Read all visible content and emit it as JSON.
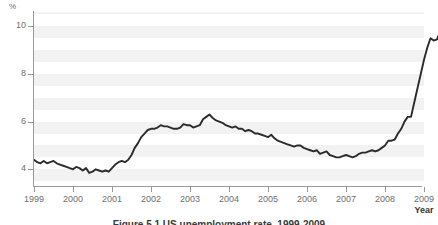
{
  "figure": {
    "caption": "Figure 5.1 US unemployment rate, 1999-2009",
    "unit_label": "%"
  },
  "chart_data": {
    "type": "line",
    "title": "US unemployment rate, 1999-2009",
    "xlabel": "Year",
    "ylabel": "%",
    "xlim": [
      1999,
      2009
    ],
    "ylim": [
      3.3,
      10.6
    ],
    "grid": false,
    "legend": "none",
    "banded_background": true,
    "x_tick_labels": [
      "1999",
      "2000",
      "2001",
      "2002",
      "2003",
      "2004",
      "2005",
      "2006",
      "2007",
      "2008",
      "2009"
    ],
    "x_ticks": [
      1999,
      2000,
      2001,
      2002,
      2003,
      2004,
      2005,
      2006,
      2007,
      2008,
      2009
    ],
    "y_tick_labels": [
      "4",
      "6",
      "8",
      "10"
    ],
    "y_ticks": [
      4,
      6,
      8,
      10
    ],
    "series": [
      {
        "name": "US unemployment rate",
        "color": "#2b2b2b",
        "x": [
          1999.0,
          1999.083,
          1999.167,
          1999.25,
          1999.333,
          1999.417,
          1999.5,
          1999.583,
          1999.667,
          1999.75,
          1999.833,
          1999.917,
          2000.0,
          2000.083,
          2000.167,
          2000.25,
          2000.333,
          2000.417,
          2000.5,
          2000.583,
          2000.667,
          2000.75,
          2000.833,
          2000.917,
          2001.0,
          2001.083,
          2001.167,
          2001.25,
          2001.333,
          2001.417,
          2001.5,
          2001.583,
          2001.667,
          2001.75,
          2001.833,
          2001.917,
          2002.0,
          2002.083,
          2002.167,
          2002.25,
          2002.333,
          2002.417,
          2002.5,
          2002.583,
          2002.667,
          2002.75,
          2002.833,
          2002.917,
          2003.0,
          2003.083,
          2003.167,
          2003.25,
          2003.333,
          2003.417,
          2003.5,
          2003.583,
          2003.667,
          2003.75,
          2003.833,
          2003.917,
          2004.0,
          2004.083,
          2004.167,
          2004.25,
          2004.333,
          2004.417,
          2004.5,
          2004.583,
          2004.667,
          2004.75,
          2004.833,
          2004.917,
          2005.0,
          2005.083,
          2005.167,
          2005.25,
          2005.333,
          2005.417,
          2005.5,
          2005.583,
          2005.667,
          2005.75,
          2005.833,
          2005.917,
          2006.0,
          2006.083,
          2006.167,
          2006.25,
          2006.333,
          2006.417,
          2006.5,
          2006.583,
          2006.667,
          2006.75,
          2006.833,
          2006.917,
          2007.0,
          2007.083,
          2007.167,
          2007.25,
          2007.333,
          2007.417,
          2007.5,
          2007.583,
          2007.667,
          2007.75,
          2007.833,
          2007.917,
          2008.0,
          2008.083,
          2008.167,
          2008.25,
          2008.333,
          2008.417,
          2008.5,
          2008.583,
          2008.667,
          2008.75,
          2008.833,
          2008.917,
          2009.0
        ],
        "values": [
          4.4,
          4.3,
          4.25,
          4.35,
          4.25,
          4.3,
          4.35,
          4.25,
          4.2,
          4.15,
          4.1,
          4.05,
          4.0,
          4.1,
          4.05,
          3.95,
          4.05,
          3.85,
          3.9,
          4.0,
          3.95,
          3.9,
          3.95,
          3.9,
          4.05,
          4.2,
          4.3,
          4.35,
          4.3,
          4.4,
          4.6,
          4.9,
          5.1,
          5.35,
          5.5,
          5.65,
          5.7,
          5.7,
          5.75,
          5.85,
          5.8,
          5.8,
          5.75,
          5.7,
          5.7,
          5.75,
          5.9,
          5.85,
          5.85,
          5.75,
          5.8,
          5.85,
          6.1,
          6.2,
          6.3,
          6.15,
          6.05,
          6.0,
          5.95,
          5.85,
          5.8,
          5.75,
          5.8,
          5.7,
          5.7,
          5.6,
          5.65,
          5.6,
          5.5,
          5.5,
          5.45,
          5.4,
          5.35,
          5.45,
          5.3,
          5.2,
          5.15,
          5.1,
          5.05,
          5.0,
          4.95,
          5.0,
          5.0,
          4.9,
          4.85,
          4.8,
          4.75,
          4.8,
          4.65,
          4.7,
          4.75,
          4.6,
          4.55,
          4.5,
          4.5,
          4.55,
          4.6,
          4.55,
          4.5,
          4.55,
          4.65,
          4.7,
          4.7,
          4.75,
          4.8,
          4.75,
          4.8,
          4.9,
          5.0,
          5.2,
          5.2,
          5.25,
          5.5,
          5.7,
          6.0,
          6.2,
          6.2,
          6.8,
          7.4,
          8.0,
          8.6
        ]
      }
    ],
    "extra_points": {
      "note": "series continues to peak near 10.1 at the right edge",
      "tail_x": [
        2009.083,
        2009.167,
        2009.25,
        2009.333,
        2009.417,
        2009.5
      ],
      "tail_values": [
        9.1,
        9.5,
        9.4,
        9.45,
        9.8,
        10.1
      ]
    }
  }
}
